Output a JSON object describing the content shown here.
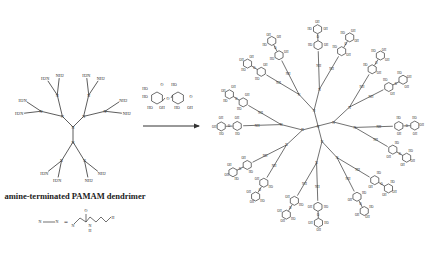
{
  "figure": {
    "left_molecule": {
      "caption": "amine-terminated PAMAM dendrimer",
      "core_label": "N",
      "branch_label": "N",
      "terminal_groups": [
        "H2N",
        "NH2"
      ],
      "generation_count": 2,
      "terminal_count": 24
    },
    "legend": {
      "left": "N—N",
      "equals": "=",
      "repeat_unit_labels": [
        "N",
        "O",
        "N",
        "H",
        "N",
        "H"
      ]
    },
    "reagent": {
      "name": "lactobionolactone (sugar lactone)",
      "labels": [
        "HO",
        "HO",
        "OH",
        "HO",
        "O",
        "O",
        "O",
        "HO",
        "OH",
        "HO",
        "OH",
        "HO"
      ]
    },
    "arrow": {
      "direction": "right"
    },
    "right_molecule": {
      "description": "sugar-modified PAMAM dendrimer",
      "core_label": "N",
      "linker_labels": [
        "NH",
        "H"
      ],
      "sugar_labels": [
        "HO",
        "OH",
        "O"
      ],
      "terminal_count": 24
    }
  }
}
